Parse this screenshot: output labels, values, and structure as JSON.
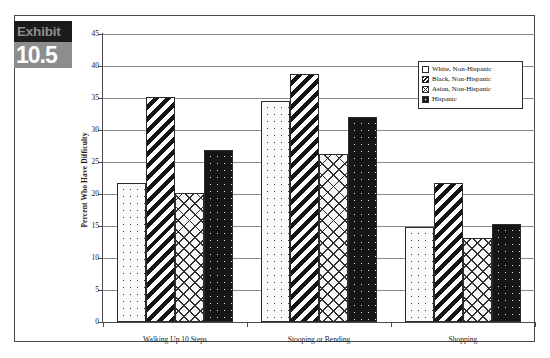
{
  "exhibit": {
    "label": "Exhibit",
    "number": "10.5"
  },
  "chart_data": {
    "type": "bar",
    "title": "",
    "xlabel": "",
    "ylabel": "Percent Who Have Difficulty",
    "ylim": [
      0,
      45
    ],
    "ytick_step": 5,
    "yticks": [
      "0",
      "5",
      "10",
      "15",
      "20",
      "25",
      "30",
      "35",
      "40",
      "45"
    ],
    "grid": true,
    "legend_position": "top-right",
    "categories": [
      "Walking Up 10 Steps",
      "Stooping or Bending",
      "Shopping"
    ],
    "series": [
      {
        "name": "White, Non-Hispanic",
        "pattern": "white-dotted",
        "values": [
          21.7,
          34.6,
          14.9
        ]
      },
      {
        "name": "Black, Non-Hispanic",
        "pattern": "diagonal-stripe",
        "values": [
          35.2,
          38.8,
          21.7
        ]
      },
      {
        "name": "Asian, Non-Hispanic",
        "pattern": "cross-hatch",
        "values": [
          20.1,
          26.3,
          13.1
        ]
      },
      {
        "name": "Hispanic",
        "pattern": "black-dotted",
        "values": [
          26.8,
          32.1,
          15.3
        ]
      }
    ]
  },
  "legend": {
    "items": [
      {
        "label": "White, Non-Hispanic"
      },
      {
        "label": "Black, Non-Hispanic"
      },
      {
        "label": "Asian, Non-Hispanic"
      },
      {
        "label": "Hispanic"
      }
    ]
  },
  "colors": {
    "frame": "#4a4a4a",
    "grid": "#8c8c8c",
    "bar_outline": "#2b2b2b",
    "exhibit_dark": "#1b1b1b",
    "exhibit_gray": "#8d8d8d",
    "background": "#ffffff"
  }
}
